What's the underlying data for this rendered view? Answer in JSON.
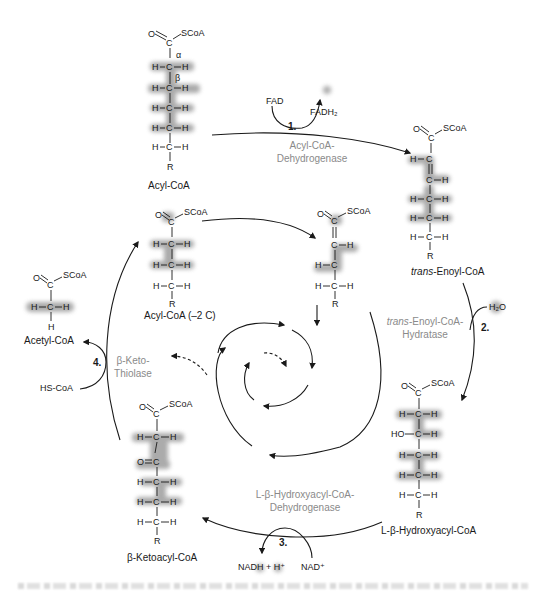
{
  "molecules": {
    "acyl_coa": {
      "name": "Acyl-CoA",
      "alpha": "α",
      "beta": "β"
    },
    "trans_enoyl_coa": {
      "name_italic": "trans",
      "name_rest": "-Enoyl-CoA"
    },
    "hydroxyacyl_coa": {
      "name": "L-β-Hydroxyacyl-CoA"
    },
    "ketoacyl_coa": {
      "name": "β-Ketoacyl-CoA"
    },
    "acetyl_coa": {
      "name": "Acetyl-CoA"
    },
    "acyl_coa_minus2": {
      "name": "Acyl-CoA (–2 C)"
    }
  },
  "atoms": {
    "O": "O",
    "C": "C",
    "H": "H",
    "R": "R",
    "SCoA": "SCoA",
    "HO": "HO"
  },
  "steps": [
    {
      "number": "1.",
      "enzyme_line1": "Acyl-CoA-",
      "enzyme_line2": "Dehydrogenase",
      "cofactor_in": "FAD",
      "cofactor_out": "FADH₂"
    },
    {
      "number": "2.",
      "enzyme_line1_italic": "trans",
      "enzyme_line1_rest": "-Enoyl-CoA-",
      "enzyme_line2": "Hydratase",
      "cofactor_in": "H₂O"
    },
    {
      "number": "3.",
      "enzyme_line1": "L-β-Hydroxyacyl-CoA-",
      "enzyme_line2": "Dehydrogenase",
      "cofactor_in": "NAD⁺",
      "cofactor_out": "NADH + H⁺"
    },
    {
      "number": "4.",
      "enzyme_line1": "β-Keto-",
      "enzyme_line2": "Thiolase",
      "cofactor_in": "HS-CoA",
      "cofactor_out": "Acetyl-CoA"
    }
  ],
  "colors": {
    "ink": "#1a1a1a",
    "enzyme_text": "#8a8a8a",
    "highlight": "#9a9a9a",
    "background": "#ffffff"
  }
}
